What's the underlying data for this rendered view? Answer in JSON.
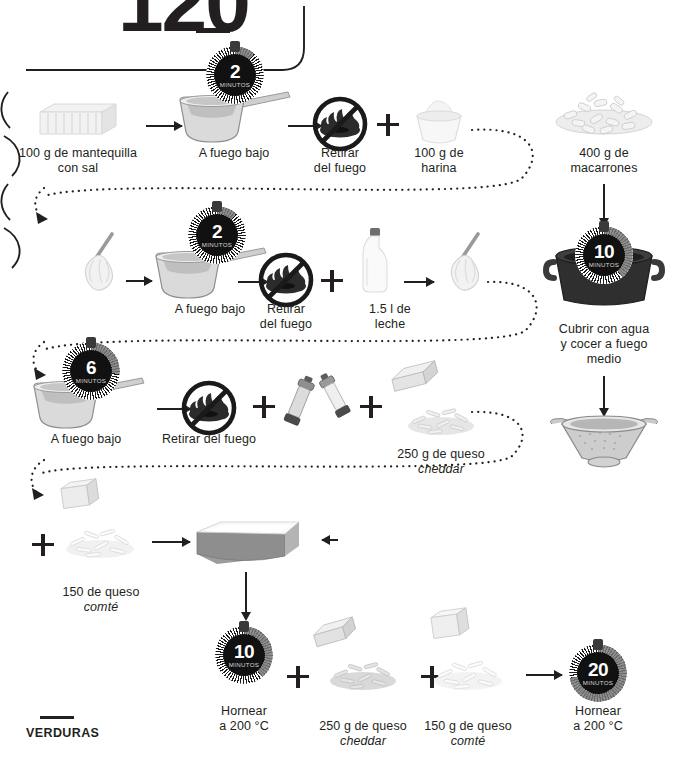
{
  "page": {
    "number": "120",
    "footer_label": "VERDURAS"
  },
  "timers": {
    "butter_melt": {
      "value": "2",
      "unit": "MINUTOS"
    },
    "roux": {
      "value": "2",
      "unit": "MINUTOS"
    },
    "bechamel": {
      "value": "6",
      "unit": "MINUTOS"
    },
    "pasta_boil": {
      "value": "10",
      "unit": "MINUTOS"
    },
    "bake_first": {
      "value": "10",
      "unit": "MINUTOS"
    },
    "bake_second": {
      "value": "20",
      "unit": "MINUTOS"
    }
  },
  "steps": {
    "butter": {
      "label": "100 g de mantequilla\ncon sal"
    },
    "low_heat_1": {
      "label": "A fuego bajo"
    },
    "off_heat_1": {
      "label": "Retirar\ndel fuego"
    },
    "flour": {
      "label": "100 g de\nharina"
    },
    "macaroni": {
      "label": "400 g de\nmacarrones"
    },
    "low_heat_2": {
      "label": "A fuego bajo"
    },
    "off_heat_2": {
      "label": "Retirar\ndel fuego"
    },
    "milk": {
      "label": "1.5 l de\nleche"
    },
    "cover_water": {
      "label": "Cubrir con agua\ny cocer a fuego\nmedio"
    },
    "low_heat_3": {
      "label": "A fuego bajo"
    },
    "off_heat_3": {
      "label": "Retirar del fuego"
    },
    "cheddar_sauce": {
      "amount": "250 g de queso",
      "variety": "cheddar"
    },
    "comte_dish": {
      "amount": "150 de queso",
      "variety": "comté"
    },
    "bake_first_label": {
      "label": "Hornear\na 200 °C"
    },
    "cheddar_top": {
      "amount": "250 g de queso",
      "variety": "cheddar"
    },
    "comte_top": {
      "amount": "150 g de queso",
      "variety": "comté"
    },
    "bake_second_label": {
      "label": "Hornear\na 200 °C"
    }
  },
  "icons": {
    "butter": "butter-block-icon",
    "saucepan": "saucepan-icon",
    "no_flame": "no-flame-icon",
    "flour_bowl": "flour-bowl-icon",
    "whisk": "whisk-icon",
    "milk_bottle": "milk-bottle-icon",
    "pasta_pile": "macaroni-pile-icon",
    "stock_pot": "stock-pot-icon",
    "colander": "colander-icon",
    "salt_grinder": "salt-grinder-icon",
    "pepper_grinder": "pepper-grinder-icon",
    "grated_cheese": "grated-cheese-pile-icon",
    "cheese_block": "cheese-block-icon",
    "baking_dish": "baking-dish-icon",
    "plus": "plus-icon",
    "arrow": "arrow-icon"
  },
  "colors": {
    "ink": "#231f20",
    "timer_face": "#111111",
    "timer_arc": "#7a7a7a",
    "paper": "#ffffff"
  }
}
